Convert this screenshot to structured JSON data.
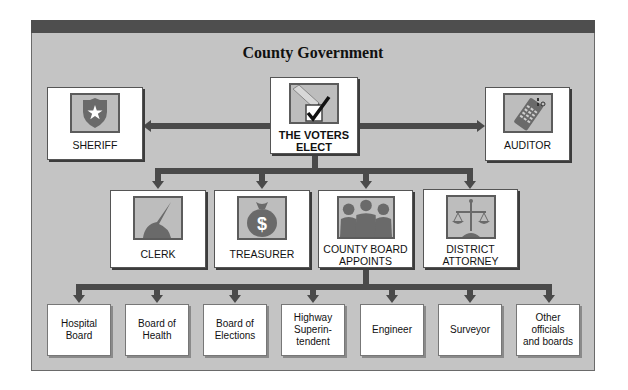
{
  "title": "County Government",
  "top_row": {
    "sheriff": {
      "label": "SHERIFF",
      "icon": "badge-icon"
    },
    "voters": {
      "label": "THE VOTERS\nELECT",
      "icon": "ballot-check-icon"
    },
    "auditor": {
      "label": "AUDITOR",
      "icon": "calculator-icon"
    }
  },
  "middle_row": [
    {
      "label": "CLERK",
      "icon": "quill-pen-icon"
    },
    {
      "label": "TREASURER",
      "icon": "money-bag-icon"
    },
    {
      "label": "COUNTY BOARD\nAPPOINTS",
      "icon": "board-members-icon"
    },
    {
      "label": "DISTRICT\nATTORNEY",
      "icon": "scales-of-justice-icon"
    }
  ],
  "bottom_row": [
    {
      "label": "Hospital\nBoard"
    },
    {
      "label": "Board of\nHealth"
    },
    {
      "label": "Board of\nElections"
    },
    {
      "label": "Highway\nSuperin-\ntendent"
    },
    {
      "label": "Engineer"
    },
    {
      "label": "Surveyor"
    },
    {
      "label": "Other\nofficials\nand boards"
    }
  ],
  "colors": {
    "panel": "#c4c4c4",
    "header_bar": "#4e4e4e",
    "connector": "#4a4a4a",
    "icon_fill": "#6a6a6a"
  }
}
